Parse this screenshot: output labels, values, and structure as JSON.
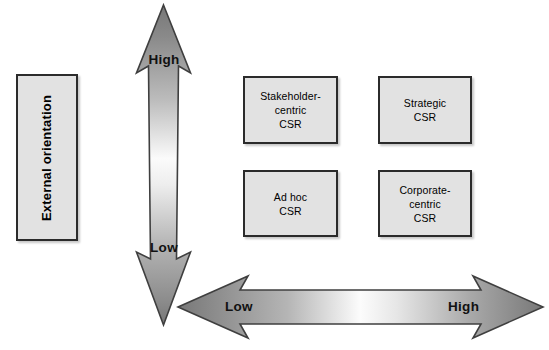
{
  "diagram": {
    "axes": {
      "vertical": {
        "name": "External orientation",
        "low_label": "Low",
        "high_label": "High",
        "arrow_style": "double-headed-vertical"
      },
      "horizontal": {
        "name": "",
        "low_label": "Low",
        "high_label": "High",
        "arrow_style": "double-headed-horizontal"
      }
    },
    "axis_box": {
      "label": "External orientation"
    },
    "quadrants": [
      {
        "id": "stakeholder-centric",
        "label": "Stakeholder-\ncentric\nCSR",
        "position": "top-left",
        "vertical_level": "High",
        "horizontal_level": "Low"
      },
      {
        "id": "strategic",
        "label": "Strategic\nCSR",
        "position": "top-right",
        "vertical_level": "High",
        "horizontal_level": "High"
      },
      {
        "id": "ad-hoc",
        "label": "Ad hoc\nCSR",
        "position": "bottom-left",
        "vertical_level": "Low",
        "horizontal_level": "Low"
      },
      {
        "id": "corporate-centric",
        "label": "Corporate-\ncentric\nCSR",
        "position": "bottom-right",
        "vertical_level": "Low",
        "horizontal_level": "High"
      }
    ],
    "colors": {
      "box_fill": "#e2e2e2",
      "box_border": "#2b2b2b",
      "arrow_dark": "#6e6e6e",
      "arrow_light": "#fdfdfd",
      "arrow_outline": "#3a3a3a",
      "text": "#000000",
      "background": "#ffffff"
    }
  }
}
